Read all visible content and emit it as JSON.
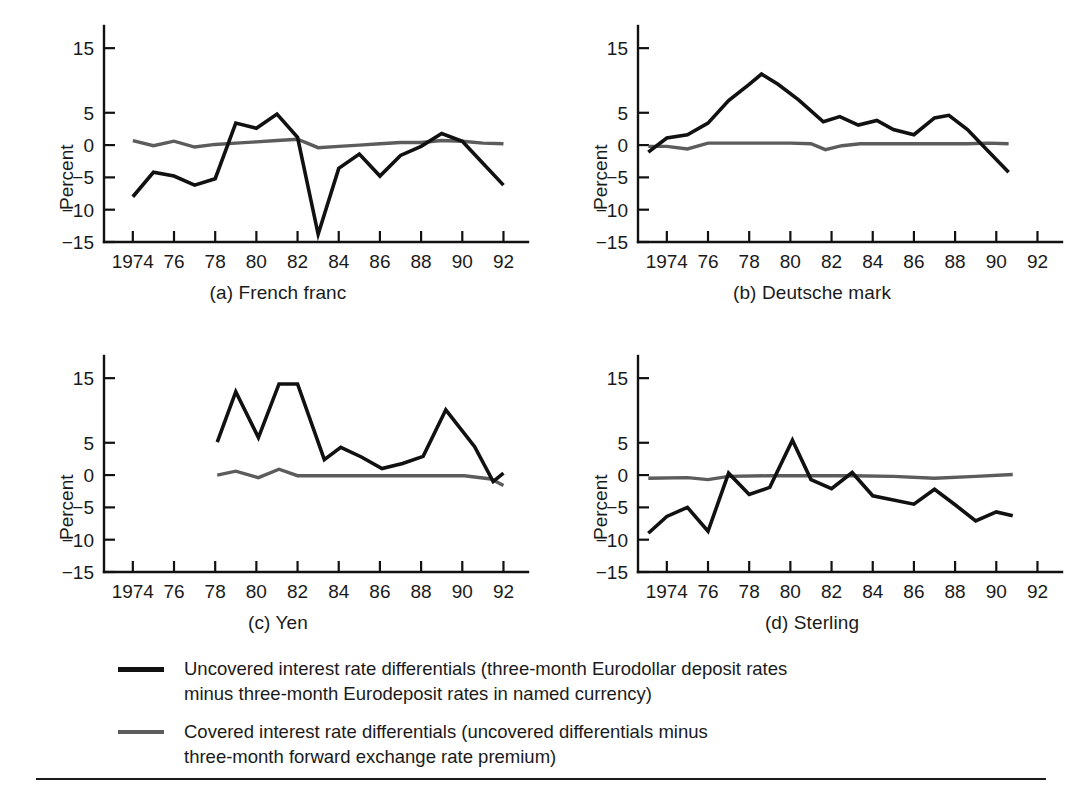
{
  "figure": {
    "ylabel": "Percent",
    "y_ticks": [
      "15",
      "5",
      "0",
      "−5",
      "−10",
      "−15"
    ],
    "x_ticks": [
      "1974",
      "76",
      "78",
      "80",
      "82",
      "84",
      "86",
      "88",
      "90",
      "92"
    ],
    "colors": {
      "uncovered": "#111111",
      "covered": "#5c5c5c",
      "axis": "#111111",
      "text": "#1a1a1a",
      "background": "#ffffff"
    }
  },
  "legend": {
    "position": "below-panels",
    "items": [
      {
        "key": "uncovered",
        "swatch_color": "#111111",
        "line1": "Uncovered interest rate differentials (three-month Eurodollar deposit rates",
        "line2": "minus three-month Eurodeposit rates in named currency)"
      },
      {
        "key": "covered",
        "swatch_color": "#5c5c5c",
        "line1": "Covered interest rate differentials (uncovered differentials minus",
        "line2": "three-month forward exchange rate premium)"
      }
    ]
  },
  "chart_data": [
    {
      "type": "line",
      "title": "(a) French franc",
      "xlabel": "",
      "ylabel": "Percent",
      "xlim": [
        1972.6,
        1992.9
      ],
      "ylim": [
        -15,
        17.5
      ],
      "xticks": [
        1974,
        1976,
        1978,
        1980,
        1982,
        1984,
        1986,
        1988,
        1990,
        1992
      ],
      "xticklabels": [
        "1974",
        "76",
        "78",
        "80",
        "82",
        "84",
        "86",
        "88",
        "90",
        "92"
      ],
      "yticks": [
        15,
        5,
        0,
        -5,
        -10,
        -15
      ],
      "yticklabels": [
        "15",
        "5",
        "0",
        "−5",
        "−10",
        "−15"
      ],
      "grid": false,
      "series": [
        {
          "name": "Uncovered interest rate differentials",
          "color": "#111111",
          "x": [
            1974.0,
            1975.0,
            1976.0,
            1977.0,
            1978.0,
            1979.0,
            1980.0,
            1981.0,
            1982.0,
            1983.0,
            1984.0,
            1985.0,
            1986.0,
            1987.0,
            1988.0,
            1989.0,
            1990.0,
            1991.0,
            1992.0
          ],
          "y": [
            -8.0,
            -4.2,
            -4.8,
            -6.2,
            -5.2,
            3.4,
            2.6,
            4.8,
            1.2,
            -13.8,
            -3.6,
            -1.4,
            -4.8,
            -1.6,
            -0.2,
            1.8,
            0.6,
            -2.8,
            -6.2
          ]
        },
        {
          "name": "Covered interest rate differentials",
          "color": "#5c5c5c",
          "x": [
            1974.0,
            1975.0,
            1976.0,
            1977.0,
            1978.0,
            1979.0,
            1980.0,
            1981.0,
            1982.0,
            1983.0,
            1984.0,
            1985.0,
            1986.0,
            1987.0,
            1988.0,
            1989.0,
            1990.0,
            1991.0,
            1992.0
          ],
          "y": [
            0.7,
            -0.1,
            0.6,
            -0.3,
            0.1,
            0.3,
            0.5,
            0.7,
            0.9,
            -0.4,
            -0.2,
            0.0,
            0.2,
            0.4,
            0.4,
            0.7,
            0.6,
            0.3,
            0.2
          ]
        }
      ]
    },
    {
      "type": "line",
      "title": "(b) Deutsche mark",
      "xlabel": "",
      "ylabel": "Percent",
      "xlim": [
        1972.6,
        1992.9
      ],
      "ylim": [
        -15,
        17.5
      ],
      "xticks": [
        1974,
        1976,
        1978,
        1980,
        1982,
        1984,
        1986,
        1988,
        1990,
        1992
      ],
      "xticklabels": [
        "1974",
        "76",
        "78",
        "80",
        "82",
        "84",
        "86",
        "88",
        "90",
        "92"
      ],
      "yticks": [
        15,
        5,
        0,
        -5,
        -10,
        -15
      ],
      "yticklabels": [
        "15",
        "5",
        "0",
        "−5",
        "−10",
        "−15"
      ],
      "grid": false,
      "series": [
        {
          "name": "Uncovered interest rate differentials",
          "color": "#111111",
          "x": [
            1973.1,
            1974.0,
            1975.0,
            1976.0,
            1977.0,
            1978.0,
            1978.6,
            1979.4,
            1980.4,
            1981.6,
            1982.4,
            1983.3,
            1984.2,
            1985.0,
            1986.0,
            1987.0,
            1987.7,
            1988.6,
            1989.6,
            1990.6
          ],
          "y": [
            -1.1,
            1.1,
            1.6,
            3.4,
            6.9,
            9.4,
            11.0,
            9.4,
            7.0,
            3.6,
            4.4,
            3.1,
            3.8,
            2.4,
            1.6,
            4.2,
            4.6,
            2.4,
            -0.9,
            -4.2
          ]
        },
        {
          "name": "Covered interest rate differentials",
          "color": "#5c5c5c",
          "x": [
            1973.1,
            1974.0,
            1975.0,
            1976.0,
            1977.0,
            1978.0,
            1979.0,
            1980.0,
            1981.0,
            1981.7,
            1982.5,
            1983.4,
            1984.4,
            1985.6,
            1986.6,
            1987.7,
            1988.6,
            1989.6,
            1990.6
          ],
          "y": [
            -0.2,
            -0.2,
            -0.6,
            0.3,
            0.3,
            0.3,
            0.3,
            0.3,
            0.2,
            -0.7,
            -0.1,
            0.2,
            0.2,
            0.2,
            0.2,
            0.2,
            0.2,
            0.3,
            0.2
          ]
        }
      ]
    },
    {
      "type": "line",
      "title": "(c) Yen",
      "xlabel": "",
      "ylabel": "Percent",
      "xlim": [
        1972.6,
        1992.9
      ],
      "ylim": [
        -15,
        17.5
      ],
      "xticks": [
        1974,
        1976,
        1978,
        1980,
        1982,
        1984,
        1986,
        1988,
        1990,
        1992
      ],
      "xticklabels": [
        "1974",
        "76",
        "78",
        "80",
        "82",
        "84",
        "86",
        "88",
        "90",
        "92"
      ],
      "yticks": [
        15,
        5,
        0,
        -5,
        -10,
        -15
      ],
      "yticklabels": [
        "15",
        "5",
        "0",
        "−5",
        "−10",
        "−15"
      ],
      "grid": false,
      "series": [
        {
          "name": "Uncovered interest rate differentials",
          "color": "#111111",
          "x": [
            1978.1,
            1979.0,
            1980.1,
            1981.1,
            1982.0,
            1983.3,
            1984.1,
            1985.1,
            1986.1,
            1987.1,
            1988.1,
            1989.2,
            1990.6,
            1991.5,
            1992.0
          ],
          "y": [
            5.1,
            12.9,
            5.8,
            14.1,
            14.1,
            2.4,
            4.3,
            2.8,
            1.0,
            1.8,
            2.9,
            10.1,
            4.4,
            -1.0,
            0.3
          ]
        },
        {
          "name": "Covered interest rate differentials",
          "color": "#5c5c5c",
          "x": [
            1978.1,
            1979.0,
            1980.1,
            1981.1,
            1982.0,
            1984.0,
            1986.0,
            1988.0,
            1990.1,
            1991.4,
            1992.0
          ],
          "y": [
            0.0,
            0.6,
            -0.4,
            0.9,
            -0.1,
            -0.1,
            -0.1,
            -0.1,
            -0.1,
            -0.6,
            -1.6
          ]
        }
      ]
    },
    {
      "type": "line",
      "title": "(d) Sterling",
      "xlabel": "",
      "ylabel": "Percent",
      "xlim": [
        1972.6,
        1992.9
      ],
      "ylim": [
        -15,
        17.5
      ],
      "xticks": [
        1974,
        1976,
        1978,
        1980,
        1982,
        1984,
        1986,
        1988,
        1990,
        1992
      ],
      "xticklabels": [
        "1974",
        "76",
        "78",
        "80",
        "82",
        "84",
        "86",
        "88",
        "90",
        "92"
      ],
      "yticks": [
        15,
        5,
        0,
        -5,
        -10,
        -15
      ],
      "yticklabels": [
        "15",
        "5",
        "0",
        "−5",
        "−10",
        "−15"
      ],
      "grid": false,
      "series": [
        {
          "name": "Uncovered interest rate differentials",
          "color": "#111111",
          "x": [
            1973.1,
            1974.0,
            1975.0,
            1976.0,
            1977.0,
            1978.0,
            1979.0,
            1980.1,
            1981.0,
            1982.0,
            1983.0,
            1984.0,
            1986.0,
            1987.0,
            1988.0,
            1989.0,
            1990.0,
            1990.8
          ],
          "y": [
            -9.0,
            -6.4,
            -5.0,
            -8.7,
            0.3,
            -3.0,
            -1.9,
            5.4,
            -0.7,
            -2.1,
            0.4,
            -3.2,
            -4.5,
            -2.2,
            -4.6,
            -7.1,
            -5.7,
            -6.3
          ]
        },
        {
          "name": "Covered interest rate differentials",
          "color": "#5c5c5c",
          "x": [
            1973.1,
            1975.0,
            1976.0,
            1977.0,
            1979.0,
            1981.0,
            1983.0,
            1985.0,
            1987.0,
            1989.0,
            1990.8
          ],
          "y": [
            -0.5,
            -0.4,
            -0.7,
            -0.2,
            -0.1,
            -0.1,
            -0.1,
            -0.2,
            -0.5,
            -0.2,
            0.1
          ]
        }
      ]
    }
  ]
}
